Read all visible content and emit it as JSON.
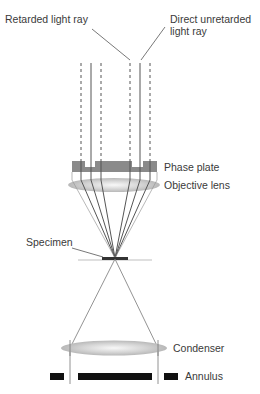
{
  "diagram": {
    "labels": {
      "retarded_ray": "Retarded light ray",
      "direct_ray_line1": "Direct unretarded",
      "direct_ray_line2": "light ray",
      "phase_plate": "Phase plate",
      "objective_lens": "Objective lens",
      "specimen": "Specimen",
      "condenser": "Condenser",
      "annulus": "Annulus"
    },
    "colors": {
      "ray": "#555555",
      "phase_plate": "#8a8a8a",
      "lens": "#c8c8c8",
      "annulus": "#111111",
      "text": "#3a3a3a"
    }
  }
}
